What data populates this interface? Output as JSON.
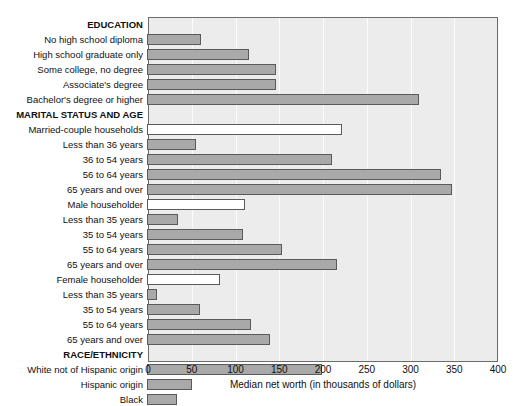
{
  "chart_data": {
    "type": "bar",
    "orientation": "horizontal",
    "title": "",
    "xlabel": "Median net worth (in thousands of dollars)",
    "ylabel": "",
    "xlim": [
      0,
      400
    ],
    "xticks": [
      0,
      50,
      100,
      150,
      200,
      250,
      300,
      350,
      400
    ],
    "grid": true,
    "legend": "none",
    "plot_background": "#ececec",
    "bar_fill": "#a9a9a9",
    "bar_fill_hollow": "#ffffff",
    "bar_border": "#5a5a5a",
    "rows": [
      {
        "label": "EDUCATION",
        "value": null,
        "type": "group"
      },
      {
        "label": "No high school diploma",
        "value": 62,
        "type": "filled"
      },
      {
        "label": "High school graduate only",
        "value": 116,
        "type": "filled"
      },
      {
        "label": "Some college, no degree",
        "value": 147,
        "type": "filled"
      },
      {
        "label": "Associate's degree",
        "value": 147,
        "type": "filled"
      },
      {
        "label": "Bachelor's degree or higher",
        "value": 311,
        "type": "filled"
      },
      {
        "label": "MARITAL STATUS AND AGE",
        "value": null,
        "type": "group"
      },
      {
        "label": "Married-couple households",
        "value": 223,
        "type": "hollow"
      },
      {
        "label": "Less than 36 years",
        "value": 56,
        "type": "filled"
      },
      {
        "label": "36 to 54 years",
        "value": 211,
        "type": "filled"
      },
      {
        "label": "56 to 64 years",
        "value": 336,
        "type": "filled"
      },
      {
        "label": "65 years and over",
        "value": 348,
        "type": "filled"
      },
      {
        "label": "Male householder",
        "value": 112,
        "type": "hollow"
      },
      {
        "label": "Less than 35 years",
        "value": 35,
        "type": "filled"
      },
      {
        "label": "35 to 54 years",
        "value": 110,
        "type": "filled"
      },
      {
        "label": "55 to 64 years",
        "value": 154,
        "type": "filled"
      },
      {
        "label": "65 years and over",
        "value": 217,
        "type": "filled"
      },
      {
        "label": "Female householder",
        "value": 83,
        "type": "hollow"
      },
      {
        "label": "Less than 35 years",
        "value": 11,
        "type": "filled"
      },
      {
        "label": "35 to 54 years",
        "value": 61,
        "type": "filled"
      },
      {
        "label": "55 to 64 years",
        "value": 119,
        "type": "filled"
      },
      {
        "label": "65 years and over",
        "value": 141,
        "type": "filled"
      },
      {
        "label": "RACE/ETHNICITY",
        "value": null,
        "type": "group"
      },
      {
        "label": "White not of Hispanic origin",
        "value": 200,
        "type": "filled"
      },
      {
        "label": "Hispanic origin",
        "value": 51,
        "type": "filled"
      },
      {
        "label": "Black",
        "value": 34,
        "type": "filled"
      }
    ]
  }
}
